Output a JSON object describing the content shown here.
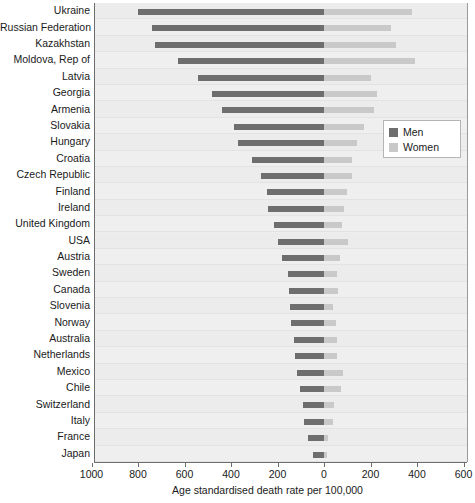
{
  "chart_data": {
    "type": "bar",
    "title": "",
    "subtitle": "",
    "xlabel": "Age standardised death rate per 100,000",
    "ylabel": "",
    "orientation": "horizontal",
    "layout": "bidirectional-population-pyramid",
    "grid": false,
    "legend_position": "middle-right",
    "axis_zero_label": "0",
    "xlim_left": 1000,
    "xlim_right": 600,
    "xticks_left": [
      1000,
      800,
      600,
      400,
      200
    ],
    "xticks_right": [
      200,
      400,
      600
    ],
    "xtick_labels": [
      "1000",
      "800",
      "600",
      "400",
      "200",
      "0",
      "200",
      "400",
      "600"
    ],
    "categories": [
      "Ukraine",
      "Russian Federation",
      "Kazakhstan",
      "Moldova, Rep of",
      "Latvia",
      "Georgia",
      "Armenia",
      "Slovakia",
      "Hungary",
      "Croatia",
      "Czech Republic",
      "Finland",
      "Ireland",
      "United Kingdom",
      "USA",
      "Austria",
      "Sweden",
      "Canada",
      "Slovenia",
      "Norway",
      "Australia",
      "Netherlands",
      "Mexico",
      "Chile",
      "Switzerland",
      "Italy",
      "France",
      "Japan"
    ],
    "series": [
      {
        "name": "Men",
        "side": "left",
        "color": "#6e6e6e",
        "values": [
          800,
          740,
          725,
          630,
          540,
          480,
          440,
          385,
          370,
          310,
          270,
          245,
          240,
          215,
          200,
          180,
          155,
          150,
          145,
          140,
          130,
          125,
          118,
          105,
          92,
          85,
          70,
          48
        ]
      },
      {
        "name": "Women",
        "side": "right",
        "color": "#c9c9c9",
        "values": [
          380,
          290,
          310,
          390,
          200,
          230,
          215,
          170,
          140,
          120,
          120,
          100,
          88,
          78,
          105,
          68,
          55,
          60,
          40,
          52,
          55,
          58,
          82,
          72,
          42,
          38,
          18,
          12
        ]
      }
    ]
  },
  "legend": {
    "items": [
      {
        "label": "Men",
        "color": "#6e6e6e"
      },
      {
        "label": "Women",
        "color": "#c9c9c9"
      }
    ]
  },
  "colors": {
    "men": "#6e6e6e",
    "women": "#c9c9c9",
    "plot_background": "#eeeeee",
    "axis": "#6d6d6d",
    "text": "#1a1a1a"
  }
}
